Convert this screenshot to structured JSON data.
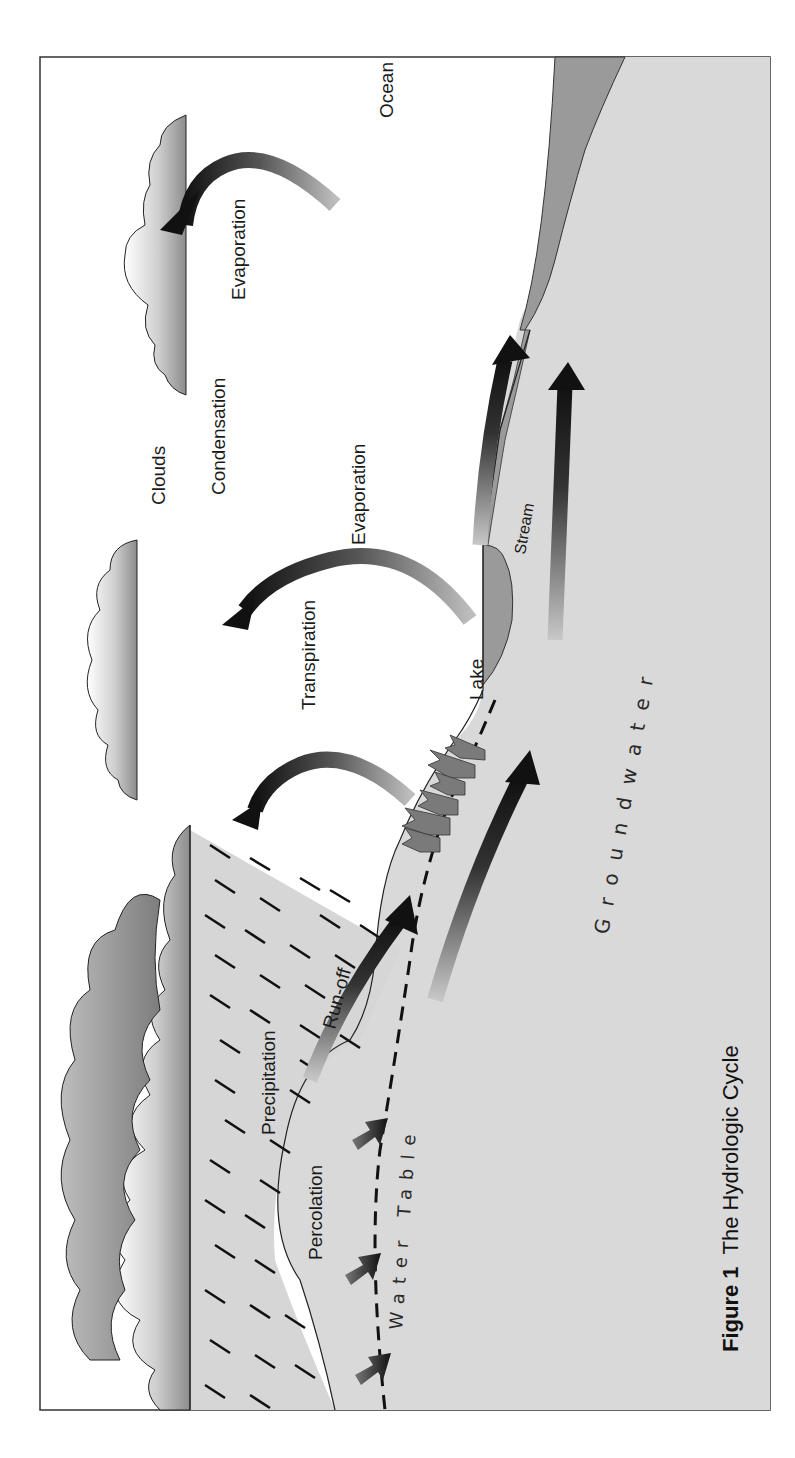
{
  "figure": {
    "number_label": "Figure 1",
    "title": "The Hydrologic Cycle",
    "orientation": "rotated 90° counter-clockwise"
  },
  "labels": {
    "ocean": "Ocean",
    "evaporation_ocean": "Evaporation",
    "condensation": "Condensation",
    "clouds": "Clouds",
    "evaporation_lake": "Evaporation",
    "stream": "Stream",
    "transpiration": "Transpiration",
    "lake": "Lake",
    "groundwater": "Groundwater",
    "run_off": "Run-off",
    "precipitation": "Precipitation",
    "percolation": "Percolation",
    "water_table": "Water Table"
  },
  "colors": {
    "ground": "#d9d9d9",
    "water_body": "#9a9a9a",
    "cloud_dark": "#8a8a8a",
    "arrow": "#111111",
    "frame": "#333333",
    "tree": "#7a7a7a"
  }
}
